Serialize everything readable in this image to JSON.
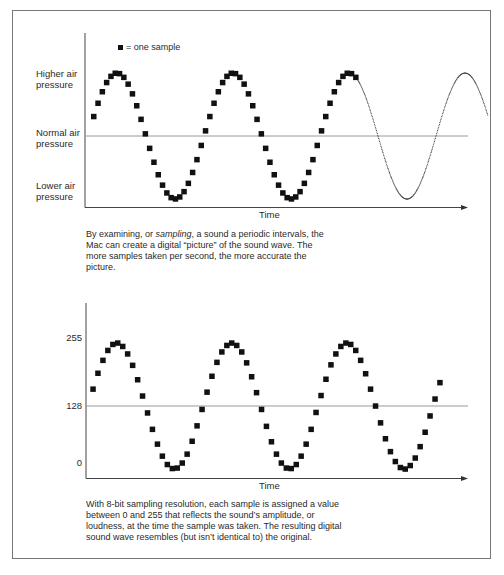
{
  "figure": {
    "top_panel": {
      "legend": {
        "marker": "filled-square",
        "label": "= one sample"
      },
      "y_labels": {
        "high": [
          "Higher air",
          "pressure"
        ],
        "normal": [
          "Normal air",
          "pressure"
        ],
        "low": [
          "Lower air",
          "pressure"
        ]
      },
      "x_label": "Time",
      "caption": {
        "part1": "By examining, or ",
        "emph": "sampling",
        "part2": ", a sound a periodic intervals, the Mac can create a digital “picture” of the sound wave. The more samples taken per second, the more accurate the picture."
      }
    },
    "bottom_panel": {
      "y_ticks": [
        "255",
        "128",
        "0"
      ],
      "x_label": "Time",
      "caption": "With 8-bit sampling resolution, each sample is assigned a value between 0 and 255 that reflects the sound’s amplitude, or loudness, at the time the sample was taken. The resulting digital sound wave resembles (but isn’t identical to) the original."
    },
    "colors": {
      "sample": "#111111",
      "axis": "#444444",
      "baseline": "#999999",
      "frame": "#777777"
    }
  },
  "chart_data": [
    {
      "type": "scatter",
      "title": "Analog sound wave sampled at periodic intervals",
      "xlabel": "Time",
      "ylabel": "Air pressure",
      "y_categories": [
        "Lower air pressure",
        "Normal air pressure",
        "Higher air pressure"
      ],
      "legend": [
        "= one sample"
      ],
      "grid": false,
      "series": [
        {
          "name": "samples",
          "style": "squares",
          "cycles": 2.25,
          "samples_per_cycle": 27,
          "amplitude": 1.0,
          "phase_start": 0.05
        },
        {
          "name": "continuous wave (unsampled)",
          "style": "dotted-line",
          "cycles_from": 2.25,
          "cycles_to": 3.45
        }
      ],
      "geometry": {
        "x0": 88,
        "period_px": 116,
        "y_center": 136,
        "amplitude_px": 63
      }
    },
    {
      "type": "scatter",
      "title": "8-bit quantized samples",
      "xlabel": "Time",
      "ylabel": "Sample value",
      "yticks": [
        0,
        128,
        255
      ],
      "ylim": [
        0,
        255
      ],
      "grid": false,
      "series": [
        {
          "name": "samples",
          "style": "squares",
          "cycles": 3.0,
          "samples_per_cycle": 23,
          "min": 0,
          "max": 255,
          "baseline": 128
        }
      ],
      "geometry": {
        "x0": 88,
        "period_px": 115,
        "y_128": 406,
        "amp_px": 63,
        "first_sample_x": 93,
        "last_sample_x": 440
      }
    }
  ],
  "cutoff_text": "· · ·"
}
